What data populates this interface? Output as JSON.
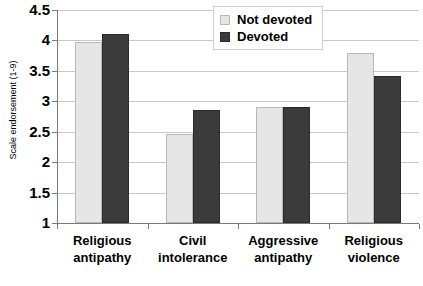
{
  "chart_data": {
    "type": "bar",
    "title": "",
    "xlabel": "",
    "ylabel": "Scale endorsement (1-9)",
    "categories": [
      "Religious antipathy",
      "Civil intolerance",
      "Aggressive antipathy",
      "Religious violence"
    ],
    "category_lines": [
      [
        "Religious",
        "antipathy"
      ],
      [
        "Civil",
        "intolerance"
      ],
      [
        "Aggressive",
        "antipathy"
      ],
      [
        "Religious",
        "violence"
      ]
    ],
    "series": [
      {
        "name": "Not devoted",
        "color": "#e6e6e6",
        "values": [
          3.98,
          2.46,
          2.9,
          3.8
        ]
      },
      {
        "name": "Devoted",
        "color": "#3b3b3b",
        "values": [
          4.1,
          2.85,
          2.9,
          3.41
        ]
      }
    ],
    "ylim": [
      1,
      4.5
    ],
    "yticks": [
      1,
      1.5,
      2,
      2.5,
      3,
      3.5,
      4,
      4.5
    ],
    "ytick_labels": [
      "1",
      "1.5",
      "2",
      "2.5",
      "3",
      "3.5",
      "4",
      "4.5"
    ],
    "grid": true,
    "legend_position": "top-center"
  },
  "legend": {
    "items": [
      {
        "label": "Not devoted",
        "swatch": "light-gray-square"
      },
      {
        "label": "Devoted",
        "swatch": "dark-gray-square"
      }
    ]
  },
  "axis": {
    "y_title": "Scale endorsement (1-9)"
  }
}
